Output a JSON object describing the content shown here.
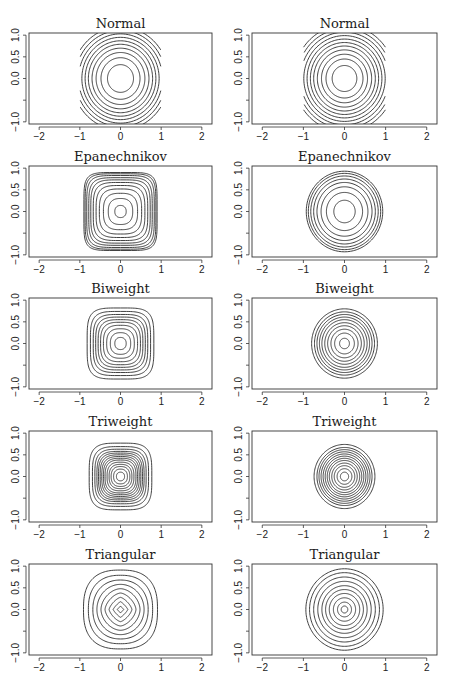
{
  "chart_data": {
    "type": "contour",
    "layout": {
      "rows": 5,
      "cols": 2,
      "grid": false,
      "legend": "none"
    },
    "axes": {
      "xlim": [
        -2.25,
        2.25
      ],
      "ylim": [
        -1.05,
        1.05
      ],
      "xticks": [
        -2,
        -1,
        0,
        1,
        2
      ],
      "xtick_labels": [
        "-2",
        "-1",
        "0",
        "1",
        "2"
      ],
      "yticks": [
        -1.0,
        -0.5,
        0.0,
        0.5,
        1.0
      ],
      "ytick_labels": [
        "-1.0",
        "",
        "0.0",
        "0.5",
        "1.0"
      ],
      "xlabel": "",
      "ylabel": ""
    },
    "panels": [
      {
        "row": 0,
        "col": 0,
        "title": "Normal",
        "shape": "normal-clipped",
        "support": 1.0,
        "levels": [
          0.32,
          0.48,
          0.6,
          0.7,
          0.79,
          0.87,
          0.95,
          1.03,
          1.11,
          1.19
        ],
        "p": 2
      },
      {
        "row": 0,
        "col": 1,
        "title": "Normal",
        "shape": "normal-clipped",
        "support": 1.0,
        "levels": [
          0.3,
          0.45,
          0.56,
          0.66,
          0.75,
          0.83,
          0.91,
          0.99,
          1.07,
          1.15,
          1.23
        ],
        "p": 2
      },
      {
        "row": 1,
        "col": 0,
        "title": "Epanechnikov",
        "shape": "superellipse",
        "support": 1.0,
        "levels": [
          0.14,
          0.3,
          0.42,
          0.52,
          0.6,
          0.67,
          0.73,
          0.78,
          0.83,
          0.87,
          0.9
        ],
        "p_inner": 2.2,
        "p_outer": 5.5
      },
      {
        "row": 1,
        "col": 1,
        "title": "Epanechnikov",
        "shape": "circle",
        "support": 1.0,
        "levels": [
          0.26,
          0.44,
          0.57,
          0.67,
          0.75,
          0.82,
          0.88,
          0.93
        ],
        "p": 2
      },
      {
        "row": 2,
        "col": 0,
        "title": "Biweight",
        "shape": "superellipse",
        "support": 0.85,
        "levels": [
          0.14,
          0.25,
          0.34,
          0.42,
          0.49,
          0.55,
          0.61,
          0.67,
          0.74,
          0.82
        ],
        "p_inner": 2.2,
        "p_outer": 4.2
      },
      {
        "row": 2,
        "col": 1,
        "title": "Biweight",
        "shape": "circle",
        "support": 0.85,
        "levels": [
          0.12,
          0.24,
          0.33,
          0.41,
          0.48,
          0.55,
          0.61,
          0.67,
          0.73,
          0.8
        ],
        "p": 2
      },
      {
        "row": 3,
        "col": 0,
        "title": "Triweight",
        "shape": "superellipse",
        "support": 0.75,
        "levels": [
          0.1,
          0.17,
          0.23,
          0.28,
          0.33,
          0.38,
          0.42,
          0.46,
          0.5,
          0.54,
          0.58,
          0.63,
          0.69,
          0.77
        ],
        "p_inner": 2.2,
        "p_outer": 3.8
      },
      {
        "row": 3,
        "col": 1,
        "title": "Triweight",
        "shape": "circle",
        "support": 0.75,
        "levels": [
          0.1,
          0.18,
          0.25,
          0.31,
          0.37,
          0.42,
          0.47,
          0.52,
          0.57,
          0.62,
          0.67,
          0.74
        ],
        "p": 2
      },
      {
        "row": 4,
        "col": 0,
        "title": "Triangular",
        "shape": "diamond-to-round",
        "support": 0.92,
        "levels": [
          0.08,
          0.18,
          0.28,
          0.38,
          0.48,
          0.58,
          0.68,
          0.79,
          0.91
        ],
        "p_inner": 1.0,
        "p_outer": 2.6
      },
      {
        "row": 4,
        "col": 1,
        "title": "Triangular",
        "shape": "circle",
        "support": 0.92,
        "levels": [
          0.08,
          0.17,
          0.27,
          0.37,
          0.46,
          0.55,
          0.65,
          0.75,
          0.85,
          0.94
        ],
        "p": 2
      }
    ]
  },
  "figure": {
    "width": 454,
    "height": 681,
    "col_left": [
      29,
      252
    ],
    "col_right": [
      212,
      437
    ],
    "row_top": [
      33,
      166,
      298,
      431,
      564
    ],
    "plot_height": 91,
    "line_color": "#2a2a2a",
    "frame_color": "#333333"
  }
}
